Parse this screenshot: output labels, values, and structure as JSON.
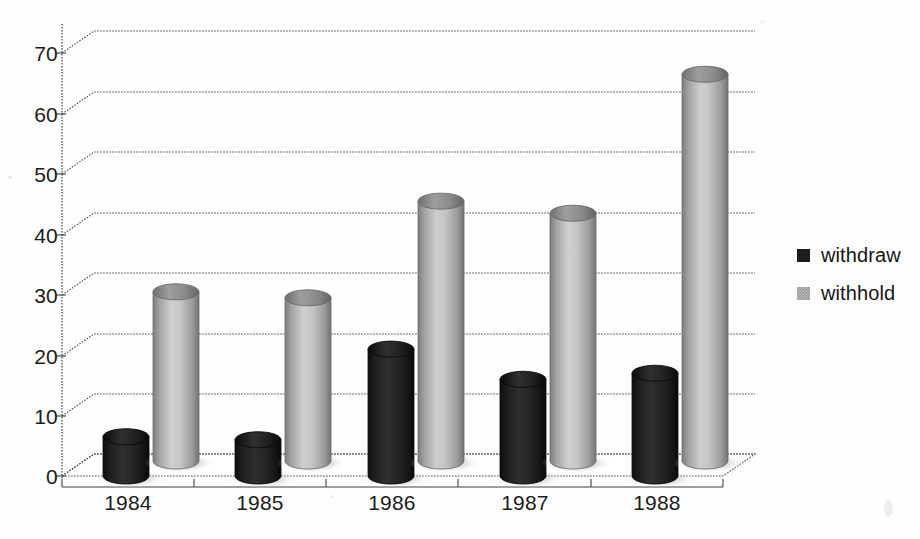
{
  "chart_data": {
    "type": "bar",
    "title": "",
    "subtitle": "",
    "xlabel": "",
    "ylabel": "",
    "categories": [
      "1984",
      "1985",
      "1986",
      "1987",
      "1988"
    ],
    "series": [
      {
        "name": "withdraw",
        "color": "#1c1c1c",
        "values": [
          6.5,
          6,
          21,
          16,
          17
        ]
      },
      {
        "name": "withhold",
        "color": "#b9b9b9",
        "values": [
          28,
          27,
          43,
          41,
          64
        ]
      }
    ],
    "ylim": [
      0,
      70
    ],
    "ytick_labels": [
      "0",
      "10",
      "20",
      "30",
      "40",
      "50",
      "60",
      "70"
    ],
    "ytick_values": [
      0,
      10,
      20,
      30,
      40,
      50,
      60,
      70
    ],
    "grid": true,
    "grid_axis": "y",
    "legend_position": "right",
    "style": "3d-cylinder",
    "background": "#ffffff"
  },
  "legend": {
    "entries": [
      {
        "label": "withdraw",
        "swatch": "dark-square-icon"
      },
      {
        "label": "withhold",
        "swatch": "light-hatched-square-icon"
      }
    ]
  },
  "axes": {
    "y": {
      "ticks": [
        "70",
        "60",
        "50",
        "40",
        "30",
        "20",
        "10",
        "0"
      ]
    },
    "x": {
      "ticks": [
        "1984",
        "1985",
        "1986",
        "1987",
        "1988"
      ]
    }
  }
}
